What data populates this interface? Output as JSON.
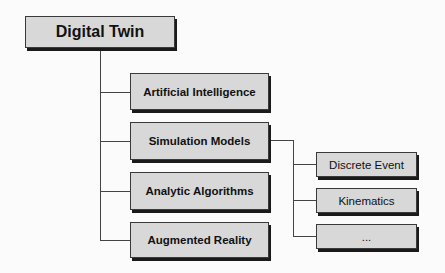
{
  "diagram": {
    "type": "hierarchy-tree",
    "root": {
      "label": "Digital Twin"
    },
    "children": [
      {
        "label": "Artificial Intelligence"
      },
      {
        "label": "Simulation Models",
        "children": [
          {
            "label": "Discrete Event"
          },
          {
            "label": "Kinematics"
          },
          {
            "label": "..."
          }
        ]
      },
      {
        "label": "Analytic Algorithms"
      },
      {
        "label": "Augmented Reality"
      }
    ],
    "colors": {
      "box_fill": "#d8d8d8",
      "box_border": "#3a3a3a",
      "shadow": "#1a1a1a",
      "connector": "#444444",
      "background": "#fbfbfb"
    }
  }
}
